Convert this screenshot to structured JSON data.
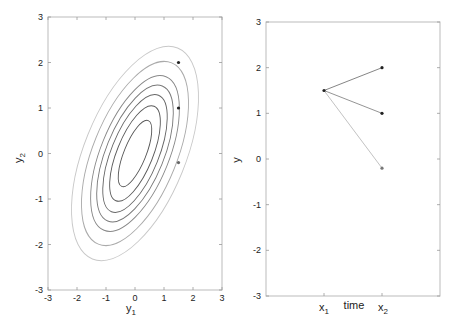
{
  "chart_data": [
    {
      "type": "contour",
      "title": "",
      "xlabel": "y_1",
      "ylabel": "y_2",
      "xlim": [
        -3,
        3
      ],
      "ylim": [
        -3,
        3
      ],
      "xticks": [
        "-3",
        "-2",
        "-1",
        "0",
        "1",
        "2",
        "3"
      ],
      "yticks": [
        "3",
        "2",
        "1",
        "0",
        "-1",
        "-2",
        "-3"
      ],
      "grid": false,
      "description": "Concentric elliptical contours of a correlated bivariate Gaussian centered at (0,0), tilted along positive correlation",
      "contours": [
        {
          "rx": 0.38,
          "ry": 0.78
        },
        {
          "rx": 0.62,
          "ry": 1.12
        },
        {
          "rx": 0.82,
          "ry": 1.38
        },
        {
          "rx": 1.0,
          "ry": 1.6
        },
        {
          "rx": 1.18,
          "ry": 1.82
        },
        {
          "rx": 1.45,
          "ry": 2.15
        },
        {
          "rx": 1.75,
          "ry": 2.5
        }
      ],
      "points": [
        {
          "x": 1.5,
          "y": 2.0
        },
        {
          "x": 1.5,
          "y": 1.0
        },
        {
          "x": 1.5,
          "y": -0.2
        }
      ]
    },
    {
      "type": "line",
      "title": "",
      "xlabel": "time",
      "ylabel": "y",
      "categories": [
        "x_1",
        "x_2"
      ],
      "ylim": [
        -3,
        3
      ],
      "yticks": [
        "3",
        "2",
        "1",
        "0",
        "-1",
        "-2",
        "-3"
      ],
      "grid": false,
      "series": [
        {
          "name": "sample 1",
          "values": [
            1.5,
            2.0
          ]
        },
        {
          "name": "sample 2",
          "values": [
            1.5,
            1.0
          ]
        },
        {
          "name": "sample 3",
          "values": [
            1.5,
            -0.2
          ]
        }
      ]
    }
  ],
  "left": {
    "xlabel": "y",
    "xlabel_sub": "1",
    "ylabel": "y",
    "ylabel_sub": "2"
  },
  "right": {
    "ylabel": "y",
    "xlabel": "time",
    "x1": "x",
    "x1_sub": "1",
    "x2": "x",
    "x2_sub": "2"
  }
}
